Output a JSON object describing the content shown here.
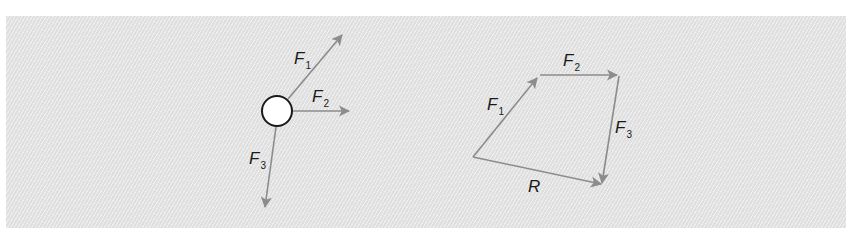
{
  "figure": {
    "background_color": "#e6e6e6",
    "arrow_color": "#8c8c8c",
    "label_color": "#1a1a1a"
  },
  "free_body": {
    "object": "circle",
    "forces": [
      {
        "symbol": "F",
        "subscript": "1",
        "direction": "up-right"
      },
      {
        "symbol": "F",
        "subscript": "2",
        "direction": "right"
      },
      {
        "symbol": "F",
        "subscript": "3",
        "direction": "down"
      }
    ]
  },
  "vector_polygon": {
    "vectors": [
      {
        "symbol": "F",
        "subscript": "1"
      },
      {
        "symbol": "F",
        "subscript": "2"
      },
      {
        "symbol": "F",
        "subscript": "3"
      },
      {
        "symbol": "R",
        "subscript": ""
      }
    ]
  }
}
